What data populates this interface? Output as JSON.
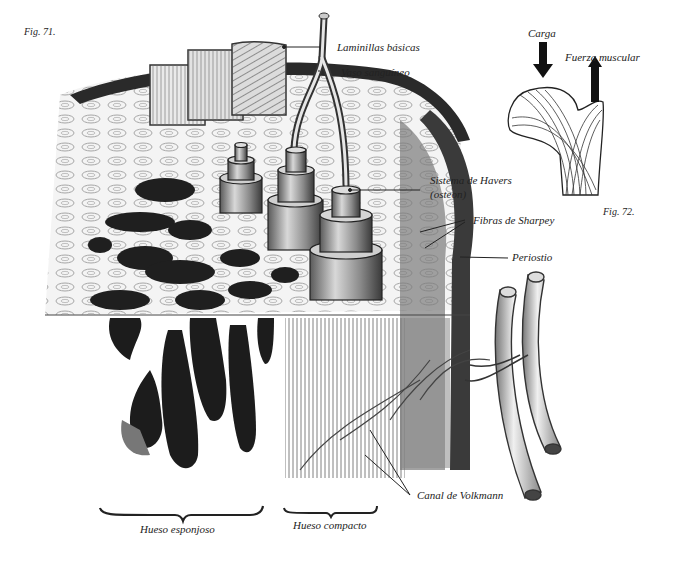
{
  "figures": {
    "fig71": {
      "caption": "Fig. 71.",
      "labels": {
        "laminillas": "Laminillas básicas",
        "vaso": "Vaso sanguíneo",
        "havers_1": "Sistema de Havers",
        "havers_2": "(osteon)",
        "sharpey": "Fibras de Sharpey",
        "periostio": "Periostio",
        "volkmann": "Canal de Volkmann",
        "esponjoso": "Hueso esponjoso",
        "compacto": "Hueso compacto"
      }
    },
    "fig72": {
      "caption": "Fig. 72.",
      "labels": {
        "carga": "Carga",
        "fuerza": "Fuerza muscular"
      }
    }
  },
  "colors": {
    "ink": "#1e1e1e",
    "shade": "#555555",
    "light": "#bdbdbd",
    "paper": "#ffffff"
  }
}
